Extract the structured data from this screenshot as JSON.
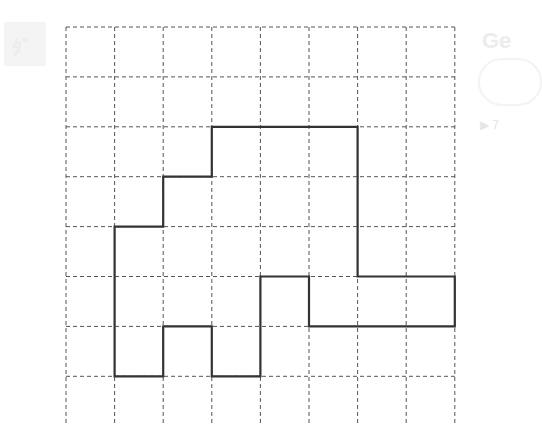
{
  "diagram": {
    "type": "grid-polygon",
    "grid": {
      "columns": 8,
      "rows_visible": 8,
      "line_style": "dashed",
      "line_color": "#555555"
    },
    "shape": {
      "stroke_color": "#333333",
      "vertices_grid_units": [
        [
          3,
          2
        ],
        [
          6,
          2
        ],
        [
          6,
          5
        ],
        [
          8,
          5
        ],
        [
          8,
          6
        ],
        [
          5,
          6
        ],
        [
          5,
          5
        ],
        [
          4,
          5
        ],
        [
          4,
          7
        ],
        [
          3,
          7
        ],
        [
          3,
          6
        ],
        [
          2,
          6
        ],
        [
          2,
          7
        ],
        [
          1,
          7
        ],
        [
          1,
          4
        ],
        [
          2,
          4
        ],
        [
          2,
          3
        ],
        [
          3,
          3
        ]
      ]
    }
  },
  "ghost": {
    "left_glyph": "ﾀﾞ",
    "right_title": "Ge",
    "right_arrow": "▶ 7"
  }
}
